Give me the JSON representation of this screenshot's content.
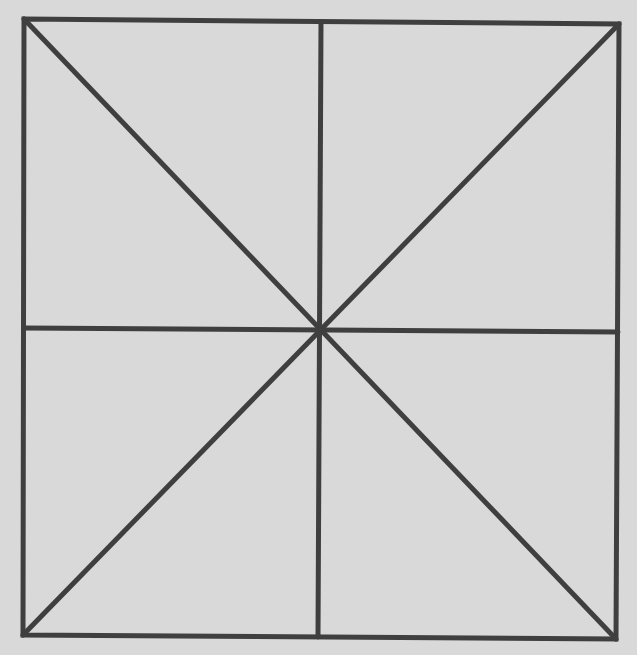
{
  "diagram": {
    "type": "square-with-diagonals-and-midlines",
    "width": 637,
    "height": 655,
    "colors": {
      "background": "#d9d9d9",
      "stroke": "#3f3f3f"
    },
    "stroke_width": 5,
    "corners": {
      "top_left": [
        24,
        19
      ],
      "top_right": [
        619,
        24
      ],
      "bottom_right": [
        616,
        639
      ],
      "bottom_left": [
        23,
        635
      ]
    },
    "center": [
      319,
      330
    ],
    "midpoints": {
      "top": [
        321,
        22
      ],
      "bottom": [
        318,
        637
      ],
      "left": [
        24,
        328
      ],
      "right": [
        618,
        332
      ]
    },
    "segments": [
      {
        "name": "diagonal-top-left-to-bottom-right",
        "from": [
          24,
          19
        ],
        "to": [
          616,
          639
        ]
      },
      {
        "name": "diagonal-top-right-to-bottom-left",
        "from": [
          619,
          24
        ],
        "to": [
          23,
          635
        ]
      },
      {
        "name": "vertical-midline",
        "from": [
          321,
          22
        ],
        "to": [
          318,
          637
        ]
      },
      {
        "name": "horizontal-midline",
        "from": [
          24,
          328
        ],
        "to": [
          618,
          332
        ]
      }
    ]
  }
}
